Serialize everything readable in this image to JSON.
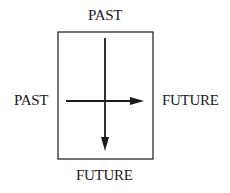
{
  "diagram": {
    "labels": {
      "top": "PAST",
      "bottom": "FUTURE",
      "left": "PAST",
      "right": "FUTURE"
    },
    "box": {
      "x": 58,
      "y": 32,
      "width": 95,
      "height": 127
    },
    "arrows": [
      {
        "name": "vertical",
        "from": "top",
        "to": "bottom",
        "direction": "down"
      },
      {
        "name": "horizontal",
        "from": "left",
        "to": "right",
        "direction": "right"
      }
    ],
    "colors": {
      "stroke": "#1a1a1a",
      "background": "#ffffff"
    }
  }
}
